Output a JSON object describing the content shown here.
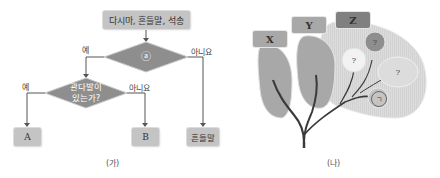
{
  "flowchart": {
    "caption": "(가)",
    "start_node": "다시마, 흔들말, 석송",
    "decision_a": "ⓐ",
    "decision_b_line1": "관다발이",
    "decision_b_line2": "있는가?",
    "labels": {
      "a_yes": "예",
      "a_no": "아니요",
      "b_yes": "예",
      "b_no": "아니요"
    },
    "result_a": "A",
    "result_b": "B",
    "result_c": "흔들말"
  },
  "tree": {
    "caption": "(나)",
    "tags": [
      "X",
      "Y",
      "Z"
    ],
    "unknowns": [
      "?",
      "?",
      "?"
    ],
    "marked_node": "ㄱ"
  },
  "colors": {
    "box_fill": "#c4c4c4",
    "diamond_fill": "#8e8e8e",
    "arrow": "#555555",
    "tree_branch": "#3a3a3a",
    "leaf": "#a8a8a8",
    "z_region": "#dcdcdc"
  }
}
